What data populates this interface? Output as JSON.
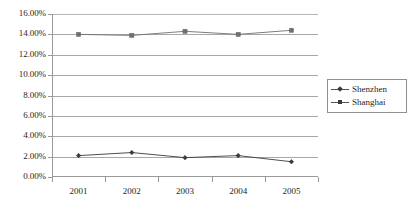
{
  "chart_data": {
    "type": "line",
    "title": "",
    "xlabel": "",
    "ylabel": "",
    "categories": [
      "2001",
      "2002",
      "2003",
      "2004",
      "2005"
    ],
    "series": [
      {
        "name": "Shenzhen",
        "marker": "diamond",
        "color": "#3a3a3a",
        "values": [
          2.1,
          2.4,
          1.9,
          2.1,
          1.5
        ]
      },
      {
        "name": "Shanghai",
        "marker": "square",
        "color": "#6e6e6e",
        "values": [
          14.0,
          13.9,
          14.3,
          14.0,
          14.4
        ]
      }
    ],
    "ylim": [
      0,
      16
    ],
    "ytick_step": 2,
    "ytick_labels": [
      "0.00%",
      "2.00%",
      "4.00%",
      "6.00%",
      "8.00%",
      "10.00%",
      "12.00%",
      "14.00%",
      "16.00%"
    ],
    "grid": "horizontal",
    "legend_position": "right",
    "value_suffix": "%"
  },
  "legend": {
    "entries": [
      {
        "label": "Shenzhen"
      },
      {
        "label": "Shanghai"
      }
    ]
  }
}
